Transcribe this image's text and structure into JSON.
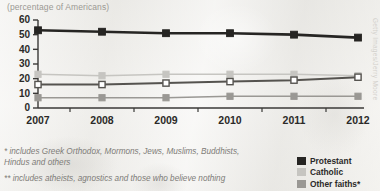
{
  "subtitle": "(percentage of Americans)",
  "watermark": "Getty Images/Jerry Moore",
  "footnotes": {
    "one": "* includes Greek Orthodox, Mormons, Jews, Muslims, Buddhists, Hindus and others",
    "two": "** includes atheists, agnostics and those who believe nothing"
  },
  "legend": {
    "items": [
      {
        "label": "Protestant",
        "color": "#262523"
      },
      {
        "label": "Catholic",
        "color": "#c6c5c1"
      },
      {
        "label": "Other faiths*",
        "color": "#9a9894"
      }
    ]
  },
  "colors": {
    "axis": "#3a3937",
    "protestant": "#262523",
    "catholic": "#c6c5c1",
    "no_religion_fill": "#ffffff",
    "no_religion_line": "#55534f",
    "other_faiths": "#9a9894",
    "text": "#2b2a28",
    "muted": "#9b9994"
  },
  "chart_data": {
    "type": "line",
    "title": "",
    "subtitle": "(percentage of Americans)",
    "xlabel": "",
    "ylabel": "",
    "categories": [
      "2007",
      "2008",
      "2009",
      "2010",
      "2011",
      "2012"
    ],
    "x": [
      2007,
      2008,
      2009,
      2010,
      2011,
      2012
    ],
    "ylim": [
      0,
      60
    ],
    "yticks": [
      0,
      10,
      20,
      30,
      40,
      50,
      60
    ],
    "grid": false,
    "legend_position": "bottom-right",
    "series": [
      {
        "name": "Protestant",
        "values": [
          53,
          52,
          51,
          51,
          50,
          48
        ],
        "color": "#262523",
        "marker": "filled-square"
      },
      {
        "name": "Catholic",
        "values": [
          23,
          22,
          23,
          23,
          23,
          22
        ],
        "color": "#c6c5c1",
        "marker": "filled-square"
      },
      {
        "name": "No religion**",
        "values": [
          16,
          16,
          17,
          18,
          19,
          21
        ],
        "color": "#ffffff",
        "marker": "open-square"
      },
      {
        "name": "Other faiths*",
        "values": [
          7,
          7,
          7,
          8,
          8,
          8
        ],
        "color": "#9a9894",
        "marker": "filled-square"
      }
    ],
    "annotations": [
      "* includes Greek Orthodox, Mormons, Jews, Muslims, Buddhists, Hindus and others",
      "** includes atheists, agnostics and those who believe nothing"
    ]
  }
}
